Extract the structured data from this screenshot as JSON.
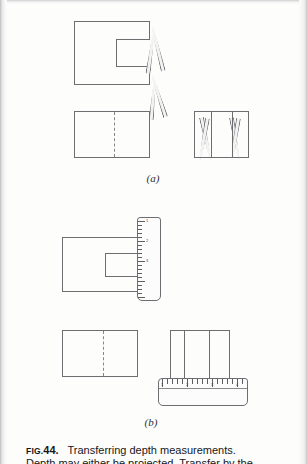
{
  "page": {
    "background_color": "#fdfdfc",
    "ink_color": "#6e6e72"
  },
  "figure": {
    "caption": {
      "fig_prefix": "FIG.",
      "fig_number": "44.",
      "title": "Transferring depth measurements.",
      "line2": "Depth may either be projected. Transfer by the"
    },
    "parts": [
      {
        "id": "a",
        "label": "(a)",
        "method": "dividers",
        "views": {
          "top_view": {
            "shape": "c-shaped-block",
            "description": "Top view of block with rectangular notch cut from right side"
          },
          "front_view": {
            "shape": "rectangle-with-hidden-centerline",
            "description": "Front view rectangle with vertical dashed hidden line"
          },
          "side_view": {
            "shape": "rectangle-with-vertical-lines",
            "vertical_line_count": 2,
            "description": "Side view rectangle with two vertical division lines"
          }
        },
        "tools": [
          {
            "name": "divider-leg",
            "count": 4,
            "description": "Divider points transferring depth from top view to side view"
          }
        ]
      },
      {
        "id": "b",
        "label": "(b)",
        "method": "scale",
        "views": {
          "top_view": {
            "shape": "c-shaped-block",
            "description": "Top view of block with rectangular notch cut from right side"
          },
          "front_view": {
            "shape": "rectangle-with-hidden-centerline",
            "description": "Front view rectangle with vertical dashed hidden line"
          },
          "side_view": {
            "shape": "rectangle-with-vertical-lines",
            "vertical_line_count": 2,
            "description": "Side view rectangle with two vertical division lines"
          }
        },
        "tools": [
          {
            "name": "vertical-scale",
            "orientation": "vertical",
            "numbers": [
              "1",
              "2",
              "3"
            ],
            "description": "Measuring scale held vertically against the top view"
          },
          {
            "name": "horizontal-scale",
            "orientation": "horizontal",
            "numbers": [
              "1",
              "2",
              "3",
              "4"
            ],
            "description": "Measuring scale laid horizontally under the side view"
          }
        ]
      }
    ]
  }
}
